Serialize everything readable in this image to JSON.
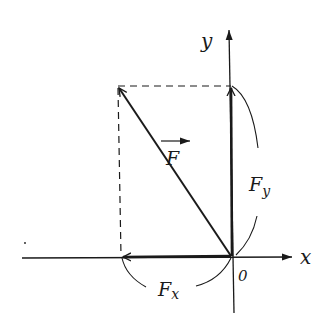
{
  "diagram": {
    "labels": {
      "y_axis": "y",
      "x_axis": "x",
      "origin": "0",
      "force": "F",
      "force_x": "F",
      "force_x_sub": "x",
      "force_y": "F",
      "force_y_sub": "y"
    },
    "colors": {
      "ink": "#1a1a1a",
      "background": "#ffffff"
    }
  }
}
